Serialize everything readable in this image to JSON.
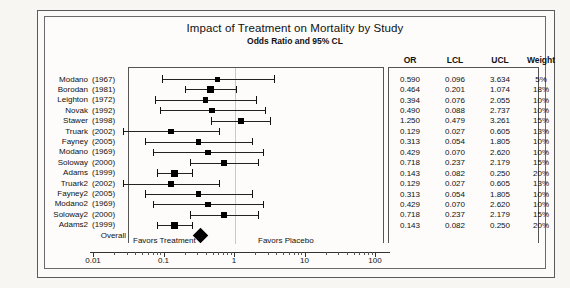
{
  "chart_data": {
    "type": "forest",
    "title": "Impact of Treatment on Mortality by Study",
    "subtitle": "Odds Ratio and 95% CL",
    "xlabel": "",
    "ylabel": "",
    "xscale": "log",
    "xlim": [
      0.01,
      100
    ],
    "xticks": [
      "0.01",
      "0.1",
      "1",
      "10",
      "100"
    ],
    "xtick_values": [
      0.01,
      0.1,
      1,
      10,
      100
    ],
    "reference_line": 1,
    "grid": false,
    "left_annotation": "Favors Treatment",
    "right_annotation": "Favors Placebo",
    "columns": [
      "OR",
      "LCL",
      "UCL",
      "Weight"
    ],
    "studies": [
      {
        "name": "Modano",
        "year": "(1967)",
        "or": "0.590",
        "lcl": "0.096",
        "ucl": "3.634",
        "weight": "5%",
        "or_v": 0.59,
        "lcl_v": 0.096,
        "ucl_v": 3.634,
        "w_v": 5
      },
      {
        "name": "Borodan",
        "year": "(1981)",
        "or": "0.464",
        "lcl": "0.201",
        "ucl": "1.074",
        "weight": "18%",
        "or_v": 0.464,
        "lcl_v": 0.201,
        "ucl_v": 1.074,
        "w_v": 18
      },
      {
        "name": "Leighton",
        "year": "(1972)",
        "or": "0.394",
        "lcl": "0.076",
        "ucl": "2.055",
        "weight": "10%",
        "or_v": 0.394,
        "lcl_v": 0.076,
        "ucl_v": 2.055,
        "w_v": 10
      },
      {
        "name": "Novak",
        "year": "(1992)",
        "or": "0.490",
        "lcl": "0.088",
        "ucl": "2.737",
        "weight": "10%",
        "or_v": 0.49,
        "lcl_v": 0.088,
        "ucl_v": 2.737,
        "w_v": 10
      },
      {
        "name": "Stawer",
        "year": "(1998)",
        "or": "1.250",
        "lcl": "0.479",
        "ucl": "3.261",
        "weight": "15%",
        "or_v": 1.25,
        "lcl_v": 0.479,
        "ucl_v": 3.261,
        "w_v": 15
      },
      {
        "name": "Truark",
        "year": "(2002)",
        "or": "0.129",
        "lcl": "0.027",
        "ucl": "0.605",
        "weight": "13%",
        "or_v": 0.129,
        "lcl_v": 0.027,
        "ucl_v": 0.605,
        "w_v": 13
      },
      {
        "name": "Fayney",
        "year": "(2005)",
        "or": "0.313",
        "lcl": "0.054",
        "ucl": "1.805",
        "weight": "10%",
        "or_v": 0.313,
        "lcl_v": 0.054,
        "ucl_v": 1.805,
        "w_v": 10
      },
      {
        "name": "Modano",
        "year": "(1969)",
        "or": "0.429",
        "lcl": "0.070",
        "ucl": "2.620",
        "weight": "10%",
        "or_v": 0.429,
        "lcl_v": 0.07,
        "ucl_v": 2.62,
        "w_v": 10
      },
      {
        "name": "Soloway",
        "year": "(2000)",
        "or": "0.718",
        "lcl": "0.237",
        "ucl": "2.179",
        "weight": "15%",
        "or_v": 0.718,
        "lcl_v": 0.237,
        "ucl_v": 2.179,
        "w_v": 15
      },
      {
        "name": "Adams",
        "year": "(1999)",
        "or": "0.143",
        "lcl": "0.082",
        "ucl": "0.250",
        "weight": "20%",
        "or_v": 0.143,
        "lcl_v": 0.082,
        "ucl_v": 0.25,
        "w_v": 20
      },
      {
        "name": "Truark2",
        "year": "(2002)",
        "or": "0.129",
        "lcl": "0.027",
        "ucl": "0.605",
        "weight": "13%",
        "or_v": 0.129,
        "lcl_v": 0.027,
        "ucl_v": 0.605,
        "w_v": 13
      },
      {
        "name": "Fayney2",
        "year": "(2005)",
        "or": "0.313",
        "lcl": "0.054",
        "ucl": "1.805",
        "weight": "10%",
        "or_v": 0.313,
        "lcl_v": 0.054,
        "ucl_v": 1.805,
        "w_v": 10
      },
      {
        "name": "Modano2",
        "year": "(1969)",
        "or": "0.429",
        "lcl": "0.070",
        "ucl": "2.620",
        "weight": "10%",
        "or_v": 0.429,
        "lcl_v": 0.07,
        "ucl_v": 2.62,
        "w_v": 10
      },
      {
        "name": "Soloway2",
        "year": "(2000)",
        "or": "0.718",
        "lcl": "0.237",
        "ucl": "2.179",
        "weight": "15%",
        "or_v": 0.718,
        "lcl_v": 0.237,
        "ucl_v": 2.179,
        "w_v": 15
      },
      {
        "name": "Adams2",
        "year": "(1999)",
        "or": "0.143",
        "lcl": "0.082",
        "ucl": "0.250",
        "weight": "20%",
        "or_v": 0.143,
        "lcl_v": 0.082,
        "ucl_v": 0.25,
        "w_v": 20
      }
    ],
    "overall": {
      "label": "Overall",
      "or_v": 0.33,
      "lcl_v": 0.24,
      "ucl_v": 0.45
    }
  },
  "colors": {
    "marker": "#000000",
    "line": "#222222",
    "reference": "#c9c9c9",
    "frame": "#555555",
    "text": "#111111"
  }
}
